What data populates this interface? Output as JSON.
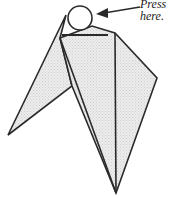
{
  "annotation": {
    "line1": "Press",
    "line2": "here."
  },
  "colors": {
    "stroke": "#2a2a2a",
    "fill": "#e6e6e6",
    "background": "#ffffff"
  },
  "shapes": {
    "circle": "press-point-circle",
    "arrow": "pointer-arrow",
    "figure": "origami-fold-diagram"
  }
}
